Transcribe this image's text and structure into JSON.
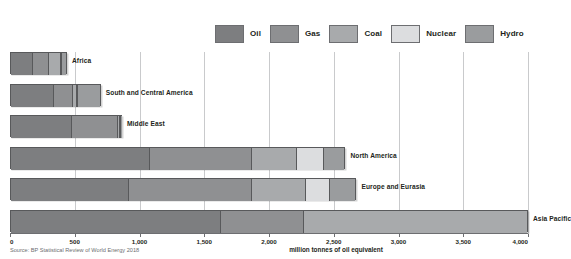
{
  "legend": {
    "items": [
      {
        "label": "Oil",
        "color": "#7d7e80",
        "icon": "legend-swatch-oil"
      },
      {
        "label": "Gas",
        "color": "#8f9092",
        "icon": "legend-swatch-gas"
      },
      {
        "label": "Coal",
        "color": "#a8aaac",
        "icon": "legend-swatch-coal"
      },
      {
        "label": "Nuclear",
        "color": "#dcdddf",
        "icon": "legend-swatch-nuclear"
      },
      {
        "label": "Hydro",
        "color": "#9a9c9e",
        "icon": "legend-swatch-hydro"
      }
    ]
  },
  "source": "Source: BP Statistical Review of World Energy 2018",
  "axis_title": "million tonnes of oil equivalent",
  "chart_data": {
    "type": "bar",
    "orientation": "horizontal",
    "stacked": true,
    "title": "",
    "xlabel": "million tonnes of oil equivalent",
    "ylabel": "",
    "xlim": [
      0,
      4000
    ],
    "xticks": [
      0,
      500,
      1000,
      1500,
      2000,
      2500,
      3000,
      3500,
      4000
    ],
    "xtick_labels": [
      "0",
      "500",
      "1,000",
      "1,500",
      "2,000",
      "2,500",
      "3,000",
      "3,500",
      "4,000"
    ],
    "grid": true,
    "grid_axis": "x",
    "legend_position": "top-right",
    "categories": [
      "Africa",
      "South and Central America",
      "Middle East",
      "North America",
      "Europe and Eurasia",
      "Asia Pacific"
    ],
    "series": [
      {
        "name": "Oil",
        "color": "#7d7e80",
        "values": [
          180,
          340,
          480,
          1080,
          920,
          1630
        ]
      },
      {
        "name": "Gas",
        "color": "#8f9092",
        "values": [
          130,
          150,
          370,
          790,
          950,
          640
        ]
      },
      {
        "name": "Coal",
        "color": "#a8aaac",
        "values": [
          95,
          35,
          10,
          350,
          420,
          1730
        ]
      },
      {
        "name": "Nuclear",
        "color": "#dcdddf",
        "values": [
          3,
          6,
          2,
          215,
          190,
          0
        ]
      },
      {
        "name": "Hydro",
        "color": "#9a9c9e",
        "values": [
          32,
          170,
          3,
          155,
          195,
          0
        ]
      }
    ],
    "totals": [
      440,
      701,
      865,
      2590,
      2675,
      4000
    ],
    "annotations": [
      "Bottom-most bar (Asia Pacific) label is cropped off the right edge of the image."
    ]
  }
}
